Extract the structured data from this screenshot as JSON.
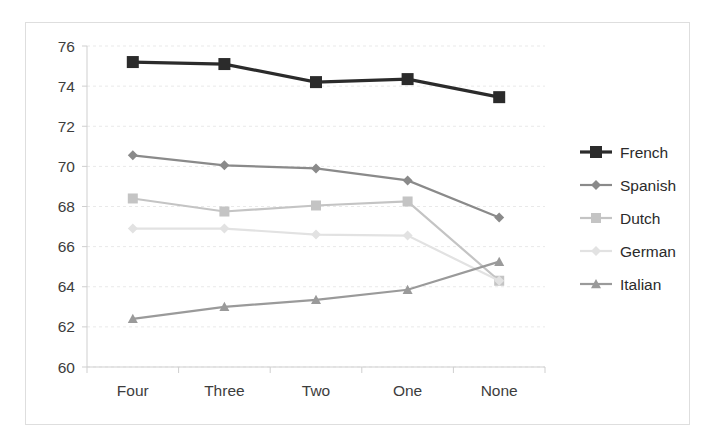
{
  "chart_data": {
    "type": "line",
    "title": "",
    "subtitle": "",
    "xlabel": "",
    "ylabel": "",
    "categories": [
      "Four",
      "Three",
      "Two",
      "One",
      "None"
    ],
    "ylim": [
      60,
      76
    ],
    "yticks": [
      60,
      62,
      64,
      66,
      68,
      70,
      72,
      74,
      76
    ],
    "ytick_labels": [
      "60",
      "62",
      "64",
      "66",
      "68",
      "70",
      "72",
      "74",
      "76"
    ],
    "grid": true,
    "legend_position": "right",
    "series": [
      {
        "name": "French",
        "marker": "square",
        "color": "#2b2b2b",
        "values": [
          75.2,
          75.1,
          74.2,
          74.35,
          73.45
        ]
      },
      {
        "name": "Spanish",
        "marker": "diamond",
        "color": "#8a8a8a",
        "values": [
          70.55,
          70.05,
          69.9,
          69.3,
          67.45
        ]
      },
      {
        "name": "Dutch",
        "marker": "square",
        "color": "#c4c4c4",
        "values": [
          68.4,
          67.75,
          68.05,
          68.25,
          64.3
        ]
      },
      {
        "name": "German",
        "marker": "diamond",
        "color": "#e2e2e2",
        "values": [
          66.9,
          66.9,
          66.6,
          66.55,
          64.3
        ]
      },
      {
        "name": "Italian",
        "marker": "triangle",
        "color": "#9a9a9a",
        "values": [
          62.4,
          63.0,
          63.35,
          63.85,
          65.25
        ]
      }
    ]
  },
  "legend": {
    "entries": [
      {
        "label": "French"
      },
      {
        "label": "Spanish"
      },
      {
        "label": "Dutch"
      },
      {
        "label": "German"
      },
      {
        "label": "Italian"
      }
    ]
  }
}
